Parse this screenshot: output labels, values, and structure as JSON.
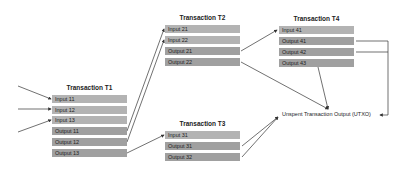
{
  "transactions": {
    "t1": {
      "title": "Transaction T1",
      "inputs": [
        "Input 11",
        "Input 12",
        "Input 13"
      ],
      "outputs": [
        "Output 11",
        "Output 12",
        "Output 13"
      ]
    },
    "t2": {
      "title": "Transaction T2",
      "inputs": [
        "Input 21",
        "Input 22"
      ],
      "outputs": [
        "Output 21",
        "Output 22"
      ]
    },
    "t3": {
      "title": "Transaction T3",
      "inputs": [
        "Input 31"
      ],
      "outputs": [
        "Output 31",
        "Output 32"
      ]
    },
    "t4": {
      "title": "Transaction T4",
      "inputs": [
        "Input 41"
      ],
      "outputs": [
        "Output 41",
        "Output 42",
        "Output 43"
      ]
    }
  },
  "utxo_label": "Unspent Transaction Output (UTXO)",
  "colors": {
    "input_row": "#b3b3b3",
    "output_row": "#a0a0a0",
    "line": "#333333"
  }
}
